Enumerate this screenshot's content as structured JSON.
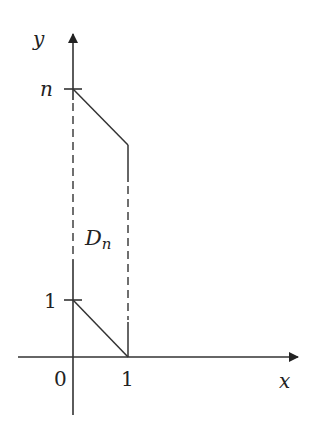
{
  "diagram": {
    "labels": {
      "y_axis": "y",
      "x_axis": "x",
      "y_tick_top": "n",
      "y_tick_bottom": "1",
      "origin": "0",
      "x_tick": "1",
      "region_main": "D",
      "region_sub": "n"
    },
    "colors": {
      "line": "#222222",
      "background": "#ffffff"
    }
  }
}
